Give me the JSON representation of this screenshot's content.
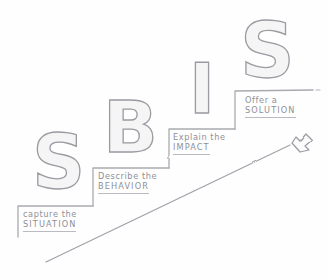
{
  "diagram": {
    "style": "hand-drawn pencil sketch",
    "background_color": "#fefefe",
    "ink_color": "#8e9096",
    "letter_outline_color": "#9a9ca2",
    "letter_fill_color": "#f4f4f5"
  },
  "acronym": {
    "letters": [
      {
        "glyph": "S",
        "name": "letter-s-situation"
      },
      {
        "glyph": "B",
        "name": "letter-b-behavior"
      },
      {
        "glyph": "I",
        "name": "letter-i-impact"
      },
      {
        "glyph": "S",
        "name": "letter-s-solution"
      }
    ]
  },
  "steps": [
    {
      "index": 1,
      "line1": "capture the",
      "line2": "SITUATION",
      "letter": "S"
    },
    {
      "index": 2,
      "line1": "Describe the",
      "line2": "BEHAVIOR",
      "letter": "B"
    },
    {
      "index": 3,
      "line1": "Explain the",
      "line2": "IMPACT",
      "letter": "I"
    },
    {
      "index": 4,
      "line1": "Offer a",
      "line2": "SOLUTION",
      "letter": "S"
    }
  ],
  "arrow": {
    "name": "upward-progress-arrow",
    "direction": "up-right"
  }
}
